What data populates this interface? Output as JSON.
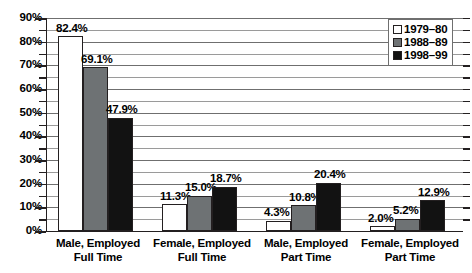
{
  "chart_data": {
    "type": "bar",
    "title": "",
    "subtitle": "",
    "xlabel": "",
    "ylabel": "",
    "ylim": [
      0,
      90
    ],
    "ytick_labels": [
      "0%",
      "10%",
      "20%",
      "30%",
      "40%",
      "50%",
      "60%",
      "70%",
      "80%",
      "90%"
    ],
    "ytick_values": [
      0,
      10,
      20,
      30,
      40,
      50,
      60,
      70,
      80,
      90
    ],
    "minor_tick_step": 5,
    "grid": true,
    "grid_axis": "y",
    "legend_position": "top-right",
    "categories": [
      "Male, Employed\nFull Time",
      "Female, Employed\nFull Time",
      "Male, Employed\nPart Time",
      "Female, Employed\nPart Time"
    ],
    "series": [
      {
        "name": "1979–80",
        "color": "#ffffff",
        "values": [
          82.4,
          11.3,
          4.3,
          2.0
        ],
        "labels": [
          "82.4%",
          "11.3%",
          "4.3%",
          "2.0%"
        ]
      },
      {
        "name": "1988–89",
        "color": "#6e7274",
        "values": [
          69.1,
          15.0,
          10.8,
          5.2
        ],
        "labels": [
          "69.1%",
          "15.0%",
          "10.8%",
          "5.2%"
        ]
      },
      {
        "name": "1998–99",
        "color": "#121212",
        "values": [
          47.9,
          18.7,
          20.4,
          12.9
        ],
        "labels": [
          "47.9%",
          "18.7%",
          "20.4%",
          "12.9%"
        ]
      }
    ]
  },
  "legend": {
    "items": [
      {
        "label": "1979–80"
      },
      {
        "label": "1988–89"
      },
      {
        "label": "1998–99"
      }
    ]
  },
  "colors": {
    "series_1979_80": "#ffffff",
    "series_1988_89": "#6e7274",
    "series_1998_99": "#121212",
    "axis": "#231f20",
    "gridline": "#9a9a9a",
    "background": "#ffffff"
  }
}
